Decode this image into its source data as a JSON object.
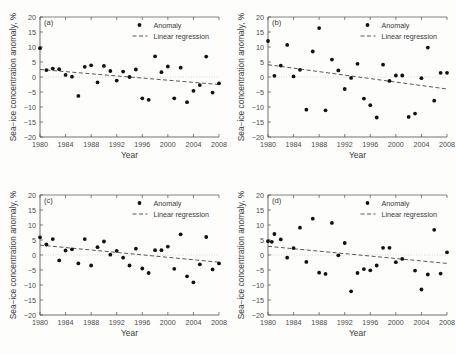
{
  "figure": {
    "title": "",
    "background_color": "#fdfdfc",
    "marker_color": "#111111",
    "line_color": "#3a3a3a"
  },
  "common": {
    "xlabel": "Year",
    "ylabel": "Sea−ice concentration anomaly, %",
    "xticks": [
      "1980",
      "1984",
      "1988",
      "1992",
      "1996",
      "2000",
      "2004",
      "2008"
    ],
    "yticks": [
      "20",
      "15",
      "10",
      "5",
      "0",
      "−5",
      "−10",
      "−15",
      "−20"
    ],
    "legend": {
      "anomaly_label": "Anomaly",
      "regression_label": "Linear regression"
    }
  },
  "chart_data": [
    {
      "type": "scatter",
      "panel": "(a)",
      "title": "",
      "xlabel": "Year",
      "ylabel": "Sea−ice concentration anomaly, %",
      "xlim": [
        1980,
        2008
      ],
      "ylim": [
        -20,
        20
      ],
      "xticks": [
        1980,
        1984,
        1988,
        1992,
        1996,
        2000,
        2004,
        2008
      ],
      "yticks": [
        -20,
        -15,
        -10,
        -5,
        0,
        5,
        10,
        15,
        20
      ],
      "grid": false,
      "legend_position": "top-right",
      "series": [
        {
          "name": "Anomaly",
          "marker": "filled-circle",
          "x": [
            1980,
            1981,
            1982,
            1983,
            1984,
            1985,
            1986,
            1987,
            1988,
            1989,
            1990,
            1991,
            1992,
            1993,
            1994,
            1995,
            1996,
            1997,
            1998,
            1999,
            2000,
            2001,
            2002,
            2003,
            2004,
            2005,
            2006,
            2007,
            2008
          ],
          "values": [
            9.6,
            2.3,
            2.8,
            2.6,
            0.7,
            0.1,
            -6.3,
            3.4,
            3.9,
            -1.8,
            3.7,
            2.0,
            -1.2,
            1.8,
            0.0,
            2.5,
            -7.1,
            -7.6,
            6.9,
            1.6,
            3.5,
            -7.1,
            3.1,
            -8.4,
            -4.6,
            -2.7,
            6.8,
            -5.2,
            -2.1
          ]
        },
        {
          "name": "Linear regression",
          "marker": "dashed-line",
          "x": [
            1980,
            2008
          ],
          "values": [
            2.5,
            -2.5
          ]
        }
      ]
    },
    {
      "type": "scatter",
      "panel": "(b)",
      "title": "",
      "xlabel": "Year",
      "ylabel": "Sea−ice concentration anomaly, %",
      "xlim": [
        1980,
        2008
      ],
      "ylim": [
        -20,
        20
      ],
      "xticks": [
        1980,
        1984,
        1988,
        1992,
        1996,
        2000,
        2004,
        2008
      ],
      "yticks": [
        -20,
        -15,
        -10,
        -5,
        0,
        5,
        10,
        15,
        20
      ],
      "grid": false,
      "legend_position": "top-right",
      "series": [
        {
          "name": "Anomaly",
          "marker": "filled-circle",
          "x": [
            1980,
            1981,
            1982,
            1983,
            1984,
            1985,
            1986,
            1987,
            1988,
            1989,
            1990,
            1991,
            1992,
            1993,
            1994,
            1995,
            1996,
            1997,
            1998,
            1999,
            2000,
            2001,
            2002,
            2003,
            2004,
            2005,
            2006,
            2007,
            2008
          ],
          "values": [
            12.0,
            0.4,
            3.8,
            10.7,
            0.2,
            2.4,
            -10.9,
            8.5,
            16.3,
            -11.1,
            5.8,
            2.2,
            -4.0,
            -0.3,
            4.4,
            -7.2,
            -9.4,
            -13.5,
            4.1,
            -1.3,
            0.5,
            0.5,
            -13.3,
            -12.2,
            -0.4,
            9.8,
            -7.9,
            1.4,
            1.4
          ]
        },
        {
          "name": "Linear regression",
          "marker": "dashed-line",
          "x": [
            1980,
            2008
          ],
          "values": [
            4.1,
            -4.0
          ]
        }
      ]
    },
    {
      "type": "scatter",
      "panel": "(c)",
      "title": "",
      "xlabel": "Year",
      "ylabel": "Sea−ice concentration anomaly, %",
      "xlim": [
        1980,
        2008
      ],
      "ylim": [
        -20,
        20
      ],
      "xticks": [
        1980,
        1984,
        1988,
        1992,
        1996,
        2000,
        2004,
        2008
      ],
      "yticks": [
        -20,
        -15,
        -10,
        -5,
        0,
        5,
        10,
        15,
        20
      ],
      "grid": false,
      "legend_position": "top-right",
      "series": [
        {
          "name": "Anomaly",
          "marker": "filled-circle",
          "x": [
            1980,
            1981,
            1982,
            1983,
            1984,
            1985,
            1986,
            1987,
            1988,
            1989,
            1990,
            1991,
            1992,
            1993,
            1994,
            1995,
            1996,
            1997,
            1998,
            1999,
            2000,
            2001,
            2002,
            2003,
            2004,
            2005,
            2006,
            2007,
            2008
          ],
          "values": [
            5.9,
            3.5,
            5.3,
            -1.8,
            1.5,
            1.9,
            -2.8,
            5.3,
            -3.5,
            2.6,
            4.5,
            0.1,
            1.4,
            -0.9,
            -3.5,
            2.1,
            -4.5,
            -6.0,
            1.6,
            1.6,
            2.8,
            -4.6,
            6.9,
            -7.1,
            -9.1,
            -3.1,
            6.0,
            -4.8,
            -2.8
          ]
        },
        {
          "name": "Linear regression",
          "marker": "dashed-line",
          "x": [
            1980,
            2008
          ],
          "values": [
            3.3,
            -2.4
          ]
        }
      ]
    },
    {
      "type": "scatter",
      "panel": "(d)",
      "title": "",
      "xlabel": "Year",
      "ylabel": "Sea−ice concentration anomaly, %",
      "xlim": [
        1980,
        2008
      ],
      "ylim": [
        -20,
        20
      ],
      "xticks": [
        1980,
        1984,
        1988,
        1992,
        1996,
        2000,
        2004,
        2008
      ],
      "yticks": [
        -20,
        -15,
        -10,
        -5,
        0,
        5,
        10,
        15,
        20
      ],
      "grid": false,
      "legend_position": "top-right",
      "series": [
        {
          "name": "Anomaly",
          "marker": "filled-circle",
          "x": [
            1980,
            1980.6,
            1981,
            1982,
            1983,
            1984,
            1985,
            1986,
            1987,
            1988,
            1989,
            1990,
            1991,
            1992,
            1993,
            1994,
            1995,
            1996,
            1997,
            1998,
            1999,
            2000,
            2001,
            2003,
            2004,
            2005,
            2006,
            2007,
            2008
          ],
          "values": [
            4.6,
            4.4,
            7.0,
            5.2,
            -0.9,
            2.3,
            9.1,
            -2.3,
            12.1,
            -5.9,
            -6.3,
            10.7,
            -0.1,
            4.0,
            -12.1,
            -6.0,
            -4.7,
            -5.1,
            -3.5,
            2.4,
            2.4,
            -2.4,
            -1.3,
            -5.2,
            -11.5,
            -6.5,
            8.4,
            -6.2,
            0.9
          ]
        },
        {
          "name": "Linear regression",
          "marker": "dashed-line",
          "x": [
            1980,
            2008
          ],
          "values": [
            2.9,
            -2.8
          ]
        }
      ]
    }
  ]
}
